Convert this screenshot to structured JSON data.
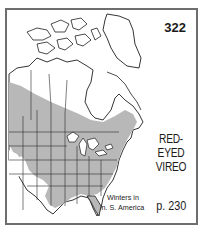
{
  "map": {
    "number": "322",
    "species": [
      "RED-EYED",
      "VIREO"
    ],
    "winter_note": [
      "Winters in",
      "n. S. America"
    ],
    "page_ref": "p. 230",
    "colors": {
      "range_fill": "#b8b8b8",
      "border": "#6e6e6e",
      "land_outline": "#1e1e1e",
      "background": "#ffffff"
    },
    "legend": {
      "range": "breeding range (gray)"
    }
  }
}
